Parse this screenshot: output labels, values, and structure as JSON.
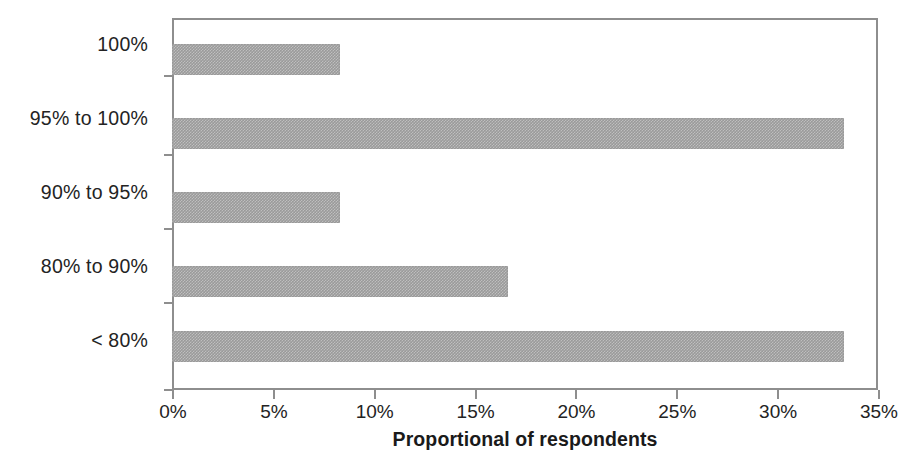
{
  "chart_data": {
    "type": "bar",
    "orientation": "horizontal",
    "title": "",
    "subtitle": "",
    "xlabel": "Proportional of respondents",
    "ylabel": "",
    "categories": [
      "100%",
      "95% to 100%",
      "90% to 95%",
      "80% to 90%",
      "< 80%"
    ],
    "values": [
      8.33,
      33.33,
      8.33,
      16.67,
      33.33
    ],
    "value_labels": [
      "8.3%",
      "33.3%",
      "8.3%",
      "16.7%",
      "33.3%"
    ],
    "xlim": [
      0,
      35
    ],
    "ylim": [
      0,
      5
    ],
    "xticks": [
      0,
      5,
      10,
      15,
      20,
      25,
      30,
      35
    ],
    "xticklabels": [
      "0%",
      "5%",
      "10%",
      "15%",
      "20%",
      "25%",
      "30%",
      "35%"
    ],
    "grid": false,
    "legend": false,
    "legend_position": "none",
    "series": [
      {
        "name": "Proportional of respondents",
        "values": [
          8.33,
          33.33,
          8.33,
          16.67,
          33.33
        ],
        "color": "#9a9a9a"
      }
    ]
  },
  "axis": {
    "x_title": "Proportional of respondents",
    "tick_0": "0%",
    "tick_1": "5%",
    "tick_2": "10%",
    "tick_3": "15%",
    "tick_4": "20%",
    "tick_5": "25%",
    "tick_6": "30%",
    "tick_7": "35%"
  },
  "categories": {
    "c0": "100%",
    "c1": "95% to 100%",
    "c2": "90% to 95%",
    "c3": "80% to 90%",
    "c4": "< 80%"
  },
  "colors": {
    "bar_fill": "#9a9a9a",
    "axis_line": "#8e8e8e",
    "text": "#232323",
    "background": "#ffffff"
  }
}
